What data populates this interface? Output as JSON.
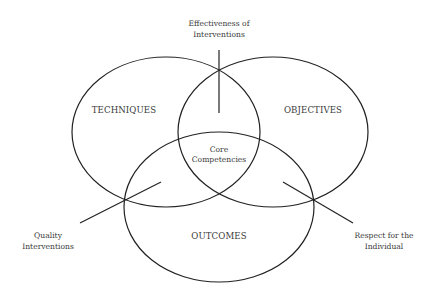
{
  "diagram": {
    "type": "venn",
    "colors": {
      "stroke": "#222222",
      "text": "#3a3a3a",
      "background": "#ffffff"
    },
    "sets": [
      {
        "id": "techniques",
        "label": "TECHNIQUES"
      },
      {
        "id": "objectives",
        "label": "OBJECTIVES"
      },
      {
        "id": "outcomes",
        "label": "OUTCOMES"
      }
    ],
    "center": {
      "line1": "Core",
      "line2": "Competencies"
    },
    "callouts": [
      {
        "id": "effectiveness",
        "line1": "Effectiveness of",
        "line2": "Interventions"
      },
      {
        "id": "quality",
        "line1": "Quality",
        "line2": "Interventions"
      },
      {
        "id": "respect",
        "line1": "Respect for the",
        "line2": "Individual"
      }
    ]
  }
}
